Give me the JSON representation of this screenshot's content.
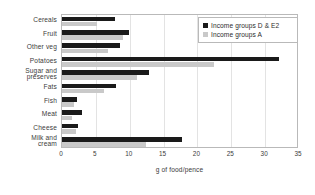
{
  "chart_data": {
    "type": "bar",
    "orientation": "horizontal",
    "title": "",
    "xlabel": "g of food/pence",
    "ylabel": "",
    "xlim": [
      0,
      35
    ],
    "xticks": [
      0,
      5,
      10,
      15,
      20,
      25,
      30,
      35
    ],
    "grid": "vertical",
    "legend_position": "top-right",
    "categories": [
      "Cereals",
      "Fruit",
      "Other veg",
      "Potatoes",
      "Sugar and preserves",
      "Fats",
      "Fish",
      "Meat",
      "Cheese",
      "Milk and cream"
    ],
    "category_labels": [
      "Cereals",
      "Fruit",
      "Other veg",
      "Potatoes",
      "Sugar and\npreserves",
      "Fats",
      "Fish",
      "Meat",
      "Cheese",
      "Milk and\ncream"
    ],
    "series": [
      {
        "name": "Income groups D & E2",
        "color": "#1a1a1a",
        "values": [
          7.8,
          9.9,
          8.6,
          32.0,
          12.9,
          8.0,
          2.2,
          3.0,
          2.4,
          17.7
        ]
      },
      {
        "name": "Income groups A",
        "color": "#c9c9c9",
        "values": [
          5.2,
          9.0,
          6.8,
          22.5,
          11.1,
          6.2,
          1.8,
          1.5,
          2.0,
          12.4
        ]
      }
    ]
  },
  "axis": {
    "x_title": "g of food/pence",
    "tick_labels": [
      "0",
      "5",
      "10",
      "15",
      "20",
      "25",
      "30",
      "35"
    ]
  },
  "legend": {
    "entries": [
      {
        "label": "Income groups D & E2",
        "color": "#1a1a1a"
      },
      {
        "label": "Income groups A",
        "color": "#c9c9c9"
      }
    ]
  }
}
